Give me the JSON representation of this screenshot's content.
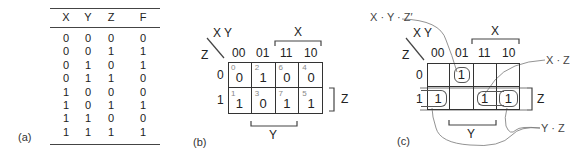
{
  "panels": {
    "a": {
      "label": "(a)",
      "headers": [
        "X",
        "Y",
        "Z",
        "F"
      ],
      "rows": [
        [
          "0",
          "0",
          "0",
          "0"
        ],
        [
          "0",
          "0",
          "1",
          "1"
        ],
        [
          "0",
          "1",
          "0",
          "1"
        ],
        [
          "0",
          "1",
          "1",
          "0"
        ],
        [
          "1",
          "0",
          "0",
          "0"
        ],
        [
          "1",
          "0",
          "1",
          "1"
        ],
        [
          "1",
          "1",
          "0",
          "0"
        ],
        [
          "1",
          "1",
          "1",
          "1"
        ]
      ]
    },
    "b": {
      "label": "(b)",
      "corner_top": "X Y",
      "corner_left": "Z",
      "col_headers": [
        "00",
        "01",
        "11",
        "10"
      ],
      "row_headers": [
        "0",
        "1"
      ],
      "cells": [
        [
          {
            "index": "0",
            "value": "0"
          },
          {
            "index": "2",
            "value": "1"
          },
          {
            "index": "6",
            "value": "0"
          },
          {
            "index": "4",
            "value": "0"
          }
        ],
        [
          {
            "index": "1",
            "value": "1"
          },
          {
            "index": "3",
            "value": "0"
          },
          {
            "index": "7",
            "value": "1"
          },
          {
            "index": "5",
            "value": "1"
          }
        ]
      ],
      "bracket_x": "X",
      "bracket_y": "Y",
      "bracket_z": "Z"
    },
    "c": {
      "label": "(c)",
      "corner_top": "X Y",
      "corner_left": "Z",
      "col_headers": [
        "00",
        "01",
        "11",
        "10"
      ],
      "row_headers": [
        "0",
        "1"
      ],
      "cells": [
        [
          "",
          "1",
          "",
          ""
        ],
        [
          "1",
          "",
          "1",
          "1"
        ]
      ],
      "bracket_x": "X",
      "bracket_y": "Y",
      "bracket_z": "Z",
      "annotations": {
        "xyz": "X · Y · Z′",
        "xz": "X · Z",
        "yz": "Y · Z"
      }
    }
  }
}
